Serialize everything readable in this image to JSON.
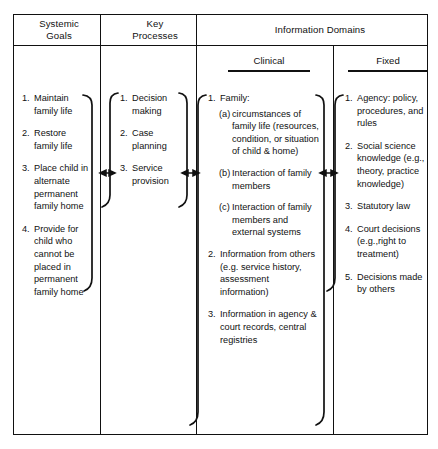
{
  "figure": {
    "type": "matrix-diagram"
  },
  "headers": {
    "systemic_goals": "Systemic\nGoals",
    "systemic_goals_line1": "Systemic",
    "systemic_goals_line2": "Goals",
    "key_processes_line1": "Key",
    "key_processes_line2": "Processes",
    "information_domains": "Information Domains",
    "clinical": "Clinical",
    "fixed": "Fixed"
  },
  "columns": {
    "systemic_goals": {
      "label": "Systemic Goals",
      "items": [
        {
          "num": "1.",
          "text": "Maintain family life"
        },
        {
          "num": "2.",
          "text": "Restore family life"
        },
        {
          "num": "3.",
          "text": "Place child in alternate permanent family home"
        },
        {
          "num": "4.",
          "text": "Provide for child who cannot be placed in permanent family home"
        }
      ]
    },
    "key_processes": {
      "label": "Key Processes",
      "items": [
        {
          "num": "1.",
          "text": "Decision making"
        },
        {
          "num": "2.",
          "text": "Case planning"
        },
        {
          "num": "3.",
          "text": "Service provision"
        }
      ]
    },
    "clinical": {
      "label": "Clinical",
      "items": [
        {
          "num": "1.",
          "text": "Family:"
        },
        {
          "num": "(a)",
          "text": "circumstances of family life (resources, condition, or situation of child & home)",
          "sub": true
        },
        {
          "num": "(b)",
          "text": "Interaction of family members",
          "sub": true
        },
        {
          "num": "(c)",
          "text": "Interaction of family members and external systems",
          "sub": true
        },
        {
          "num": "2.",
          "text": "Information from others (e.g. service history, assessment information)"
        },
        {
          "num": "3.",
          "text": "Information in agency & court records, central registries"
        }
      ]
    },
    "fixed": {
      "label": "Fixed",
      "items": [
        {
          "num": "1.",
          "text": "Agency: policy, procedures, and rules"
        },
        {
          "num": "2.",
          "text": "Social science knowledge (e.g., theory, practice knowledge)"
        },
        {
          "num": "3.",
          "text": "Statutory law"
        },
        {
          "num": "4.",
          "text": "Court decisions (e.g.,right to treatment)"
        },
        {
          "num": "5.",
          "text": "Decisions made by others"
        }
      ]
    }
  },
  "connectors": {
    "count": 3,
    "style": "double-headed-arrow",
    "description": "Bidirectional arrows linking Systemic Goals to Key Processes, Key Processes to Clinical domain, and Clinical domain to Fixed domain"
  },
  "colors": {
    "ink": "#111111",
    "background": "#ffffff"
  }
}
